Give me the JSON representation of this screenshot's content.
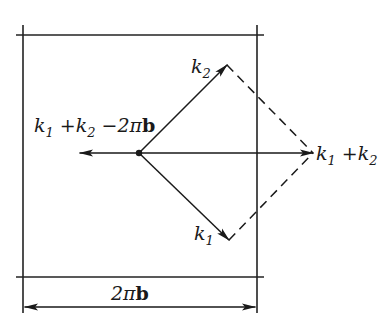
{
  "diagram": {
    "labels": {
      "k2": {
        "base": "k",
        "sub": "2"
      },
      "k1": {
        "base": "k",
        "sub": "1"
      },
      "sum": {
        "parts": [
          "k",
          "1",
          " +",
          "k",
          "2"
        ]
      },
      "umklapp": {
        "parts": [
          "k",
          "1",
          " +",
          "k",
          "2",
          " −2π",
          "b"
        ]
      },
      "width": {
        "prefix": "2π",
        "bold": "b"
      }
    },
    "points": {
      "origin": [
        139,
        153
      ],
      "k2_tip": [
        227,
        65
      ],
      "k1_tip": [
        229,
        240
      ],
      "sum_tip": [
        313,
        153
      ],
      "umklapp_tip": [
        80,
        153
      ]
    },
    "frame": {
      "left_x": 23,
      "right_x": 257,
      "top_y": 35,
      "bottom_y": 277,
      "dimension_y": 307
    },
    "colors": {
      "ink": "#1a1a1a",
      "background": "#ffffff"
    }
  }
}
